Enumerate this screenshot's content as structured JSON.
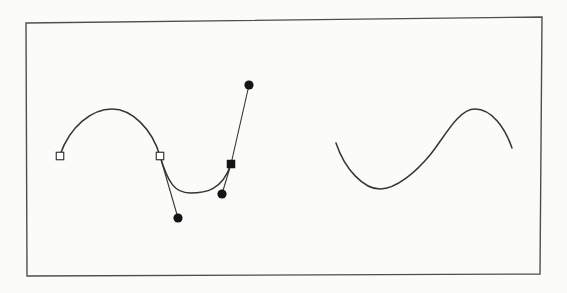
{
  "figure": {
    "canvas": {
      "width": 567,
      "height": 293,
      "background": "#fbfbfa"
    },
    "frame": {
      "points": "26,23 542,17 540,274 27,276",
      "stroke": "#4e4e4e",
      "stroke_width": 1.4
    },
    "curve_style": {
      "stroke": "#353535",
      "stroke_width": 1.5
    },
    "curves": [
      {
        "name": "edited-curve",
        "d": "M 60,155 C 70,126 92,109 112,109 C 132,109 152,129 160,156 C 168,183 175,193 190,193 C 205,193 222,191 231,164"
      },
      {
        "name": "plain-curve",
        "d": "M 336,143 C 345,170 364,189 380,189 C 396,189 416,172 430,155 C 444,138 458,109 475,109 C 492,109 505,128 512,148"
      }
    ],
    "direction_lines": [
      {
        "x1": 160,
        "y1": 156,
        "x2": 178,
        "y2": 218
      },
      {
        "x1": 249,
        "y1": 85,
        "x2": 231,
        "y2": 164
      },
      {
        "x1": 231,
        "y1": 164,
        "x2": 222,
        "y2": 194
      }
    ],
    "markers": {
      "open_square_fill": "#ffffff",
      "open_square_stroke": "#2a2a2a",
      "solid_fill": "#141414",
      "open_squares": [
        {
          "cx": 60,
          "cy": 156,
          "size": 7.5
        },
        {
          "cx": 160,
          "cy": 156,
          "size": 7.5
        }
      ],
      "filled_squares": [
        {
          "cx": 231,
          "cy": 164,
          "size": 8.5
        }
      ],
      "filled_circles": [
        {
          "cx": 249,
          "cy": 85,
          "r": 4.6
        },
        {
          "cx": 178,
          "cy": 218,
          "r": 4.6
        },
        {
          "cx": 222,
          "cy": 194,
          "r": 4.6
        }
      ]
    }
  }
}
